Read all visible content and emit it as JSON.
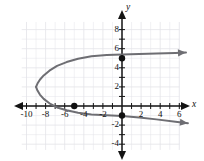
{
  "chart_data": {
    "type": "line",
    "title": "",
    "xlabel": "x",
    "ylabel": "y",
    "xlim": [
      -11.5,
      7.2
    ],
    "ylim": [
      -5.2,
      9.4
    ],
    "grid": true,
    "grid_color": "#e3e3e8",
    "curve_color": "#6e6e73",
    "axis_color": "#141414",
    "point_color": "#111111",
    "legend": null,
    "xticks": [
      -10,
      -8,
      -6,
      -4,
      -2,
      2,
      4,
      6
    ],
    "xtick_labels": [
      "-10",
      "-8",
      "-6",
      "-4",
      "-2",
      "2",
      "4",
      "6"
    ],
    "yticks": [
      8,
      6,
      4,
      2,
      -2,
      -4
    ],
    "ytick_labels": [
      "8",
      "6",
      "4",
      "2",
      "-2",
      "-4"
    ],
    "minor_tick_step": 1,
    "vertex": [
      -9,
      2
    ],
    "points": [
      {
        "x": 0,
        "y": 5,
        "label": "(0, 5)"
      },
      {
        "x": -5,
        "y": 0,
        "label": "(-5, 0)"
      },
      {
        "x": 0,
        "y": -1,
        "label": "(0, -1)"
      }
    ],
    "series": [
      {
        "name": "upper-branch",
        "arrow": "end",
        "x": [
          -9.0,
          -8.85,
          -8.6,
          -8.2,
          -7.6,
          -6.8,
          -5.8,
          -4.6,
          -3.2,
          -1.6,
          0.0,
          1.8,
          3.6,
          5.6,
          6.7
        ],
        "y": [
          2.0,
          2.35,
          2.75,
          3.2,
          3.7,
          4.2,
          4.6,
          4.95,
          5.2,
          5.35,
          5.4,
          5.45,
          5.5,
          5.55,
          5.6
        ]
      },
      {
        "name": "lower-branch",
        "arrow": "end",
        "x": [
          -9.0,
          -8.85,
          -8.6,
          -8.2,
          -7.6,
          -6.8,
          -5.8,
          -4.6,
          -3.2,
          -1.6,
          0.0,
          1.8,
          3.6,
          5.6,
          6.9
        ],
        "y": [
          2.0,
          1.62,
          1.2,
          0.75,
          0.28,
          -0.15,
          -0.45,
          -0.7,
          -0.88,
          -0.98,
          -1.05,
          -1.2,
          -1.4,
          -1.65,
          -1.8
        ]
      }
    ]
  },
  "axis_labels": {
    "x": "x",
    "y": "y"
  }
}
